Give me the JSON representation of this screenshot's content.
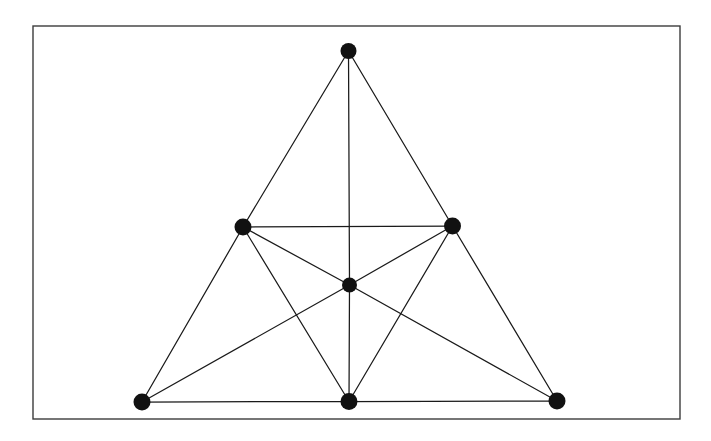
{
  "figure": {
    "background_color": "#ffffff",
    "frame": {
      "name": "figure-border",
      "x": 33,
      "y": 26,
      "width": 647,
      "height": 393,
      "stroke_color": "#3c3c3c",
      "stroke_width": 1.4
    },
    "style": {
      "edge_color": "#1a1a1a",
      "edge_width": 1.25,
      "node_color": "#111111"
    }
  },
  "chart_data": {
    "type": "diagram",
    "subtype": "node-link-graph",
    "xlabel": "",
    "ylabel": "",
    "grid": false,
    "legend": false,
    "axis_visible": false,
    "coordinate_space": {
      "x_range": [
        0,
        711
      ],
      "y_range": [
        0,
        441
      ],
      "y_axis_down": true
    },
    "node_count": 7,
    "edge_count": 15,
    "nodes": [
      {
        "id": "apex",
        "label": "",
        "x": 348.5,
        "y": 51.0,
        "r": 8.0,
        "degree": 3
      },
      {
        "id": "mid-left",
        "label": "",
        "x": 243.0,
        "y": 227.0,
        "r": 8.5,
        "degree": 5
      },
      {
        "id": "mid-right",
        "label": "",
        "x": 452.5,
        "y": 226.0,
        "r": 8.5,
        "degree": 5
      },
      {
        "id": "center",
        "label": "",
        "x": 349.5,
        "y": 285.0,
        "r": 7.5,
        "degree": 6
      },
      {
        "id": "bottom-left",
        "label": "",
        "x": 142.0,
        "y": 402.0,
        "r": 8.5,
        "degree": 3
      },
      {
        "id": "bottom-middle",
        "label": "",
        "x": 349.0,
        "y": 401.5,
        "r": 8.5,
        "degree": 5
      },
      {
        "id": "bottom-right",
        "label": "",
        "x": 557.0,
        "y": 401.0,
        "r": 8.5,
        "degree": 3
      }
    ],
    "edges": [
      {
        "id": "e1",
        "source": "apex",
        "target": "mid-left",
        "kind": "outer-left"
      },
      {
        "id": "e2",
        "source": "apex",
        "target": "mid-right",
        "kind": "outer-right"
      },
      {
        "id": "e3",
        "source": "apex",
        "target": "center",
        "kind": "vertical-upper"
      },
      {
        "id": "e4",
        "source": "mid-left",
        "target": "mid-right",
        "kind": "horizontal-middle"
      },
      {
        "id": "e5",
        "source": "mid-left",
        "target": "bottom-left",
        "kind": "outer-left"
      },
      {
        "id": "e6",
        "source": "mid-left",
        "target": "center",
        "kind": "spoke"
      },
      {
        "id": "e7",
        "source": "mid-left",
        "target": "bottom-middle",
        "kind": "diagonal"
      },
      {
        "id": "e8",
        "source": "mid-right",
        "target": "bottom-right",
        "kind": "outer-right"
      },
      {
        "id": "e9",
        "source": "mid-right",
        "target": "center",
        "kind": "spoke"
      },
      {
        "id": "e10",
        "source": "mid-right",
        "target": "bottom-middle",
        "kind": "diagonal"
      },
      {
        "id": "e11",
        "source": "center",
        "target": "bottom-left",
        "kind": "spoke"
      },
      {
        "id": "e12",
        "source": "center",
        "target": "bottom-middle",
        "kind": "vertical-lower"
      },
      {
        "id": "e13",
        "source": "center",
        "target": "bottom-right",
        "kind": "spoke"
      },
      {
        "id": "e14",
        "source": "bottom-left",
        "target": "bottom-middle",
        "kind": "base-left"
      },
      {
        "id": "e15",
        "source": "bottom-middle",
        "target": "bottom-right",
        "kind": "base-right"
      }
    ]
  }
}
